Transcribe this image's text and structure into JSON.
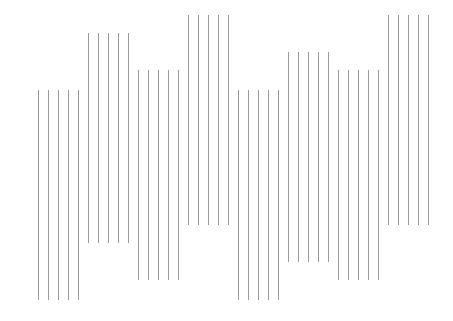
{
  "canvas": {
    "width": 453,
    "height": 321,
    "background": "#ffffff"
  },
  "line_style": {
    "color": "#9a9a9a",
    "width": 1
  },
  "pattern": {
    "lines_per_group": 5,
    "line_spacing": 10,
    "line_length": 210,
    "groups": [
      {
        "x_start": 38,
        "y_top": 90
      },
      {
        "x_start": 88,
        "y_top": 33
      },
      {
        "x_start": 138,
        "y_top": 70
      },
      {
        "x_start": 188,
        "y_top": 15
      },
      {
        "x_start": 238,
        "y_top": 90
      },
      {
        "x_start": 288,
        "y_top": 52
      },
      {
        "x_start": 338,
        "y_top": 70
      },
      {
        "x_start": 388,
        "y_top": 15
      }
    ]
  }
}
